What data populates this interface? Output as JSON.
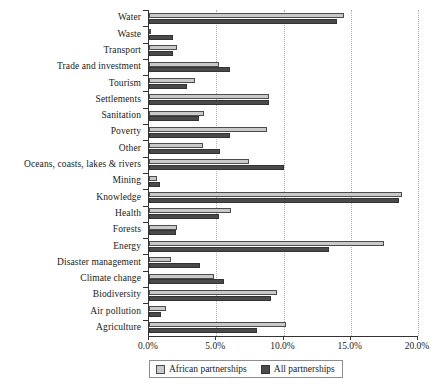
{
  "chart_data": {
    "type": "bar",
    "orientation": "horizontal",
    "title": "",
    "xlabel": "",
    "ylabel": "",
    "xlim": [
      0,
      20
    ],
    "xticks": [
      "0.0%",
      "5.0%",
      "10.0%",
      "15.0%",
      "20.0%"
    ],
    "xtick_values": [
      0,
      5,
      10,
      15,
      20
    ],
    "grid": "vertical-dotted",
    "legend_position": "bottom",
    "categories": [
      "Water",
      "Waste",
      "Transport",
      "Trade and investment",
      "Tourism",
      "Settlements",
      "Sanitation",
      "Poverty",
      "Other",
      "Oceans, coasts, lakes & rivers",
      "Mining",
      "Knowledge",
      "Health",
      "Forests",
      "Energy",
      "Disaster management",
      "Climate change",
      "Biodiversity",
      "Air pollution",
      "Agriculture"
    ],
    "series": [
      {
        "name": "African partnerships",
        "color": "#c9c9c9",
        "values": [
          14.5,
          0.1,
          2.1,
          5.2,
          3.4,
          8.9,
          4.1,
          8.8,
          4.0,
          7.4,
          0.6,
          18.8,
          6.1,
          2.1,
          17.5,
          1.6,
          4.8,
          9.5,
          1.3,
          10.2
        ]
      },
      {
        "name": "All partnerships",
        "color": "#4a4a4a",
        "values": [
          14.0,
          1.8,
          1.8,
          6.0,
          2.8,
          8.9,
          3.7,
          6.0,
          5.3,
          10.0,
          0.8,
          18.6,
          5.2,
          2.0,
          13.4,
          3.8,
          5.6,
          9.1,
          0.9,
          8.0
        ]
      }
    ]
  },
  "legend": {
    "items": [
      {
        "label": "African partnerships",
        "key": "african"
      },
      {
        "label": "All partnerships",
        "key": "all"
      }
    ]
  }
}
